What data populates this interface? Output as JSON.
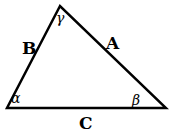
{
  "diagram": {
    "type": "triangle",
    "sides": {
      "a": "A",
      "b": "B",
      "c": "C"
    },
    "angles": {
      "alpha": "α",
      "beta": "β",
      "gamma": "γ"
    }
  }
}
